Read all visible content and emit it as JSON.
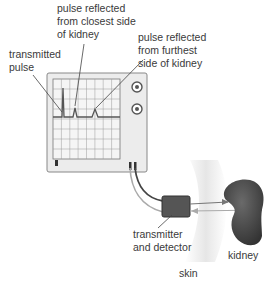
{
  "labels": {
    "closest": "pulse reflected\nfrom closest side\nof kidney",
    "transmitted": "transmitted\npulse",
    "furthest": "pulse reflected\nfrom furthest\nside of kidney",
    "transducer": "transmitter\nand detector",
    "kidney": "kidney",
    "skin": "skin"
  },
  "oscilloscope": {
    "grid_cols": 8,
    "grid_rows": 8,
    "trace_color": "#555555",
    "screen_color": "#f4f4f4",
    "frame_color": "#e9e9e9"
  },
  "colors": {
    "kidney": "#4a4a4a",
    "skin": "#ebebeb",
    "transducer": "#555555",
    "lines": "#444444"
  }
}
